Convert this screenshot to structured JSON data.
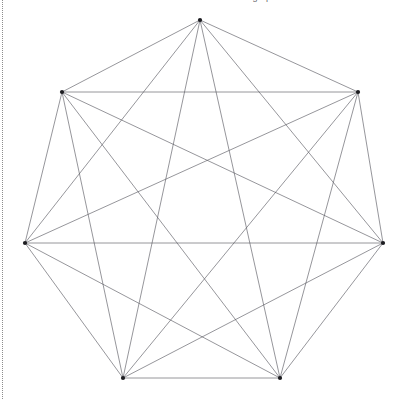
{
  "page": {
    "background_color": "#ffffff",
    "width": 399,
    "height": 399
  },
  "clipped_header": {
    "text": "Mathematica  graphics",
    "note": "partially cut off at top edge"
  },
  "left_rule": {
    "style": "dotted",
    "color": "#8d8d8d"
  },
  "chart_data": {
    "type": "scatter",
    "title": "",
    "subtitle": "",
    "xlabel": "",
    "ylabel": "",
    "grid": false,
    "legend": null,
    "graph": {
      "name": "K7",
      "vertex_count": 7,
      "edge_count": 21,
      "layout": "regular heptagon",
      "edge_color": "#55555c",
      "vertex_color": "#1c1c20",
      "edge_width": 0.62,
      "vertex_radius": 2.1
    },
    "center": {
      "x": 204,
      "y": 235
    },
    "circumradius": 215,
    "vertices": [
      {
        "id": 0,
        "label": "1",
        "x": 200,
        "y": 20
      },
      {
        "id": 1,
        "label": "2",
        "x": 358,
        "y": 92
      },
      {
        "id": 2,
        "label": "3",
        "x": 383,
        "y": 243
      },
      {
        "id": 3,
        "label": "4",
        "x": 280,
        "y": 378
      },
      {
        "id": 4,
        "label": "5",
        "x": 123,
        "y": 378
      },
      {
        "id": 5,
        "label": "6",
        "x": 25,
        "y": 243
      },
      {
        "id": 6,
        "label": "7",
        "x": 62,
        "y": 92
      }
    ],
    "edges": [
      [
        0,
        1
      ],
      [
        0,
        2
      ],
      [
        0,
        3
      ],
      [
        0,
        4
      ],
      [
        0,
        5
      ],
      [
        0,
        6
      ],
      [
        1,
        2
      ],
      [
        1,
        3
      ],
      [
        1,
        4
      ],
      [
        1,
        5
      ],
      [
        1,
        6
      ],
      [
        2,
        3
      ],
      [
        2,
        4
      ],
      [
        2,
        5
      ],
      [
        2,
        6
      ],
      [
        3,
        4
      ],
      [
        3,
        5
      ],
      [
        3,
        6
      ],
      [
        4,
        5
      ],
      [
        4,
        6
      ],
      [
        5,
        6
      ]
    ]
  }
}
